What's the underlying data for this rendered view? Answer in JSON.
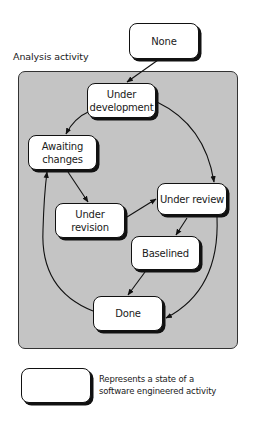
{
  "diagram": {
    "container_label": "Analysis activity",
    "container_color": "#c4c4c4",
    "states": [
      {
        "id": "none",
        "label": "None",
        "x": 129,
        "y": 23,
        "w": 70,
        "h": 36
      },
      {
        "id": "under-development",
        "label": "Under\ndevelopment",
        "x": 87,
        "y": 83,
        "w": 69,
        "h": 35
      },
      {
        "id": "awaiting-changes",
        "label": "Awaiting\nchanges",
        "x": 28,
        "y": 135,
        "w": 69,
        "h": 35
      },
      {
        "id": "under-revision",
        "label": "Under\nrevision",
        "x": 55,
        "y": 203,
        "w": 70,
        "h": 35
      },
      {
        "id": "under-review",
        "label": "Under review",
        "x": 157,
        "y": 183,
        "w": 70,
        "h": 32
      },
      {
        "id": "baselined",
        "label": "Baselined",
        "x": 131,
        "y": 236,
        "w": 69,
        "h": 34
      },
      {
        "id": "done",
        "label": "Done",
        "x": 93,
        "y": 296,
        "w": 70,
        "h": 35
      }
    ],
    "transitions": [
      {
        "from": "none",
        "to": "under-development"
      },
      {
        "from": "under-development",
        "to": "awaiting-changes"
      },
      {
        "from": "under-development",
        "to": "under-review"
      },
      {
        "from": "awaiting-changes",
        "to": "under-revision"
      },
      {
        "from": "under-revision",
        "to": "under-review"
      },
      {
        "from": "under-review",
        "to": "baselined"
      },
      {
        "from": "under-review",
        "to": "done"
      },
      {
        "from": "baselined",
        "to": "done"
      },
      {
        "from": "done",
        "to": "awaiting-changes"
      }
    ]
  },
  "legend": {
    "text": "Represents a state of a\nsoftware engineered activity"
  }
}
